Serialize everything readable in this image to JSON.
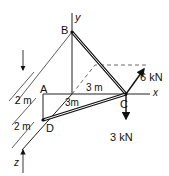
{
  "diagram": {
    "type": "3D truss / space frame statics problem",
    "points": {
      "A": "A",
      "B": "B",
      "C": "C",
      "D": "D"
    },
    "axes": {
      "x": "x",
      "y": "y",
      "z": "z"
    },
    "dimensions": {
      "a_to_origin_dim": "3 m",
      "origin_to_d_dim": "3m",
      "vertical_upper": "2 m",
      "vertical_lower": "2 m"
    },
    "loads": {
      "load_diagonal": "6 kN",
      "load_down": "3 kN"
    },
    "members": [
      "BC",
      "DC",
      "BA-extension",
      "AD",
      "OD"
    ]
  }
}
